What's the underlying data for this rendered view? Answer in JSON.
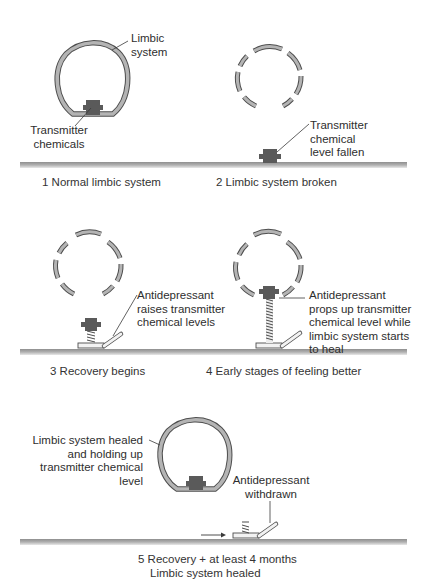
{
  "colors": {
    "ring_fill": "#b4b4b4",
    "ring_stroke": "#4d4d4d",
    "transmitter": "#5a5a5a",
    "ground": "#a8a8a8",
    "leader": "#3a3a3a",
    "text": "#2e2e2e"
  },
  "panels": [
    {
      "id": 1,
      "caption": "1  Normal limbic system",
      "labels": {
        "ring": "Limbic\nsystem",
        "transmitter": "Transmitter\nchemicals"
      }
    },
    {
      "id": 2,
      "caption": "2  Limbic system broken",
      "labels": {
        "transmitter": "Transmitter\nchemical\nlevel fallen"
      }
    },
    {
      "id": 3,
      "caption": "3  Recovery begins",
      "labels": {
        "antidepressant": "Antidepressant\nraises transmitter\nchemical levels"
      }
    },
    {
      "id": 4,
      "caption": "4  Early stages of feeling better",
      "labels": {
        "antidepressant": "Antidepressant\nprops up transmitter\nchemical level while\nlimbic system starts\nto heal"
      }
    },
    {
      "id": 5,
      "caption_line1": "5  Recovery + at least 4 months",
      "caption_line2": "Limbic system healed",
      "labels": {
        "ring": "Limbic system healed\nand holding up\ntransmitter chemical\nlevel",
        "antidepressant": "Antidepressant\nwithdrawn"
      }
    }
  ]
}
